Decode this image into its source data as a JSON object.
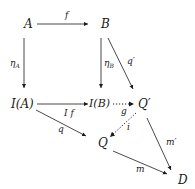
{
  "diagram": {
    "type": "commutative-diagram",
    "nodes": {
      "A": "A",
      "B": "B",
      "IA": "I(A)",
      "IB": "I(B)",
      "Qp": "Q′",
      "Q": "Q",
      "D": "D"
    },
    "edges": {
      "f": {
        "label": "f",
        "from": "A",
        "to": "B",
        "style": "solid"
      },
      "etaA": {
        "label": "η",
        "sub": "A",
        "from": "A",
        "to": "I(A)",
        "style": "solid"
      },
      "etaB": {
        "label": "η",
        "sub": "B",
        "from": "B",
        "to": "I(B)",
        "style": "solid"
      },
      "qp": {
        "label": "q′",
        "from": "B",
        "to": "Q′",
        "style": "solid"
      },
      "If": {
        "label": "I f",
        "from": "I(A)",
        "to": "I(B)",
        "style": "solid"
      },
      "q": {
        "label": "q",
        "from": "I(A)",
        "to": "Q",
        "style": "solid"
      },
      "g": {
        "label": "g",
        "from": "I(B)",
        "to": "Q′",
        "style": "dotted"
      },
      "i": {
        "label": "i",
        "from": "Q′",
        "to": "Q",
        "style": "dotted"
      },
      "mp": {
        "label": "m′",
        "from": "Q′",
        "to": "D",
        "style": "solid"
      },
      "m": {
        "label": "m",
        "from": "Q",
        "to": "D",
        "style": "solid"
      }
    }
  }
}
